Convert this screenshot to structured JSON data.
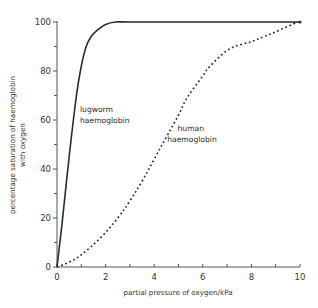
{
  "chart_data": {
    "type": "line",
    "title": "",
    "xlabel": "partial pressure of oxygen/kPa",
    "ylabel_lines": [
      "percentage saturation of haemoglobin",
      "with oxygen"
    ],
    "ylabel": "percentage saturation of haemoglobin with oxygen",
    "xlim": [
      0,
      10
    ],
    "ylim": [
      0,
      100
    ],
    "x_ticks": [
      0,
      2,
      4,
      6,
      8,
      10
    ],
    "x_minor_ticks": [
      1,
      3,
      5,
      7,
      9
    ],
    "y_ticks": [
      0,
      20,
      40,
      60,
      80,
      100
    ],
    "y_minor_ticks": [
      10,
      30,
      50,
      70,
      90
    ],
    "grid": false,
    "legend": "none (inline labels)",
    "series": [
      {
        "name": "lugworm haemoglobin",
        "style": "solid",
        "color": "#2b2b2b",
        "label_lines": [
          "lugworm",
          "haemoglobin"
        ],
        "x": [
          0,
          0.2,
          0.5,
          0.8,
          1.0,
          1.2,
          1.4,
          1.7,
          2.0,
          2.4,
          3.0,
          5.0,
          7.0,
          10.0
        ],
        "y": [
          0,
          17,
          45,
          70,
          82,
          90,
          94,
          97,
          99,
          100,
          100,
          100,
          100,
          100
        ]
      },
      {
        "name": "human haemoglobin",
        "style": "dotted",
        "color": "#2b2b2b",
        "label_lines": [
          "human",
          "haemoglobin"
        ],
        "x": [
          0,
          0.5,
          1.0,
          1.8,
          2.5,
          3.0,
          3.5,
          4.0,
          4.5,
          5.0,
          5.35,
          6.0,
          6.3,
          7.1,
          8.0,
          8.5,
          9.0,
          9.9
        ],
        "y": [
          0,
          2,
          5,
          12,
          20,
          27,
          35,
          44,
          53,
          62,
          69,
          78,
          82,
          89,
          92,
          94,
          96,
          100
        ]
      }
    ]
  },
  "axes": {
    "x_tick_labels": [
      "0",
      "2",
      "4",
      "6",
      "8",
      "10"
    ],
    "y_tick_labels": [
      "0",
      "20",
      "40",
      "60",
      "80",
      "100"
    ]
  }
}
